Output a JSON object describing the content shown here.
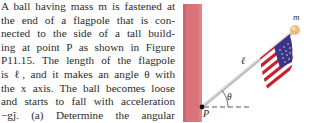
{
  "problem": {
    "lines": [
      "A ball having mass m is fastened at",
      "the end of a flagpole that is con-",
      "nected to the side of a tall build-",
      "ing at point P as shown in Figure",
      "P11.15. The length of the flagpole",
      "is ℓ, and it makes an angle θ with",
      "the x axis. The ball becomes loose",
      "and starts to fall with acceleration",
      "−gĵ. (a) Determine the angular"
    ]
  },
  "figure": {
    "labels": {
      "mass": "m",
      "length": "ℓ",
      "angle": "θ",
      "pivot": "P"
    },
    "colors": {
      "wall": "#d9757a",
      "wall_edge": "#c65e64",
      "pole": "#c9c9c9",
      "ball": "#e6c07a",
      "flag_red": "#c8202c",
      "flag_blue": "#3a3588",
      "dashed_line": "#555555"
    }
  }
}
